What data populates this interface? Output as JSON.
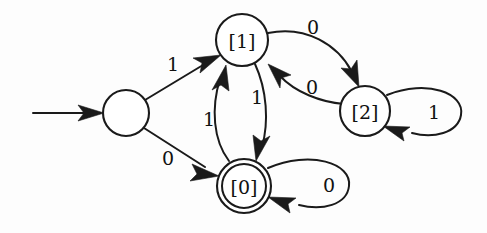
{
  "diagram": {
    "kind": "finite-automaton-state-diagram",
    "width": 487,
    "height": 233,
    "background_color": "#fdfdfd",
    "ink_color": "#1a1a1a",
    "states": [
      {
        "id": "start",
        "label": "",
        "accepting": false,
        "is_start": true,
        "cx": 126,
        "cy": 113,
        "r": 23
      },
      {
        "id": "s1",
        "label": "[1]",
        "accepting": false,
        "is_start": false,
        "cx": 242,
        "cy": 40,
        "r": 26
      },
      {
        "id": "s0",
        "label": "[0]",
        "accepting": true,
        "is_start": false,
        "cx": 244,
        "cy": 186,
        "r": 27,
        "r_inner": 22
      },
      {
        "id": "s2",
        "label": "[2]",
        "accepting": false,
        "is_start": false,
        "cx": 365,
        "cy": 111,
        "r": 25
      }
    ],
    "start_arrow": {
      "from_x": 33,
      "to_x": 103,
      "y": 113
    },
    "transitions": [
      {
        "id": "t-start-1",
        "from": "start",
        "to": "s1",
        "symbol": "1",
        "label_x": 173,
        "label_y": 64
      },
      {
        "id": "t-start-0",
        "from": "start",
        "to": "s0",
        "symbol": "0",
        "label_x": 168,
        "label_y": 158
      },
      {
        "id": "t-0-1",
        "from": "s0",
        "to": "s1",
        "symbol": "1",
        "label_x": 209,
        "label_y": 119
      },
      {
        "id": "t-1-0",
        "from": "s1",
        "to": "s0",
        "symbol": "1",
        "label_x": 257,
        "label_y": 97
      },
      {
        "id": "t-1-2",
        "from": "s1",
        "to": "s2",
        "symbol": "0",
        "label_x": 313,
        "label_y": 27
      },
      {
        "id": "t-2-1",
        "from": "s2",
        "to": "s1",
        "symbol": "0",
        "label_x": 312,
        "label_y": 87
      },
      {
        "id": "t-0-0",
        "from": "s0",
        "to": "s0",
        "symbol": "0",
        "label_x": 329,
        "label_y": 185,
        "self_loop": true
      },
      {
        "id": "t-2-2",
        "from": "s2",
        "to": "s2",
        "symbol": "1",
        "label_x": 434,
        "label_y": 112,
        "self_loop": true
      }
    ]
  }
}
